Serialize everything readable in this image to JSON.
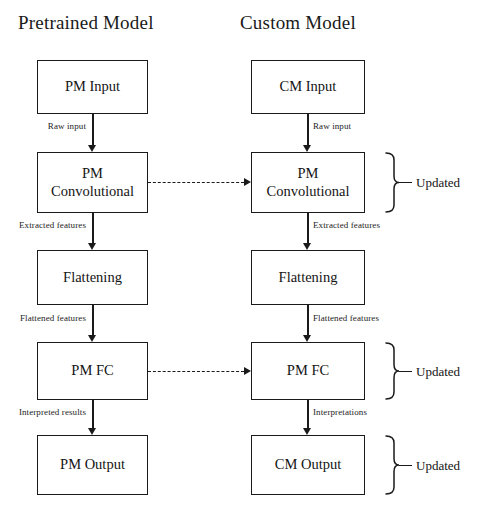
{
  "columns": {
    "left": {
      "title": "Pretrained Model"
    },
    "right": {
      "title": "Custom Model"
    }
  },
  "nodes": {
    "left": [
      {
        "id": "pm-input",
        "label": "PM Input"
      },
      {
        "id": "pm-convolutional",
        "label": "PM\nConvolutional"
      },
      {
        "id": "pm-flattening",
        "label": "Flattening"
      },
      {
        "id": "pm-fc",
        "label": "PM FC"
      },
      {
        "id": "pm-output",
        "label": "PM Output"
      }
    ],
    "right": [
      {
        "id": "cm-input",
        "label": "CM Input"
      },
      {
        "id": "cm-convolutional",
        "label": "PM\nConvolutional"
      },
      {
        "id": "cm-flattening",
        "label": "Flattening"
      },
      {
        "id": "cm-fc",
        "label": "PM FC"
      },
      {
        "id": "cm-output",
        "label": "CM Output"
      }
    ]
  },
  "edge_labels": {
    "left": [
      "Raw input",
      "Extracted features",
      "Flattened features",
      "Interpreted results"
    ],
    "right": [
      "Raw input",
      "Extracted features",
      "Flattened features",
      "Interpretations"
    ]
  },
  "annotations": [
    {
      "id": "updated-conv",
      "text": "Updated"
    },
    {
      "id": "updated-fc",
      "text": "Updated"
    },
    {
      "id": "updated-output",
      "text": "Updated"
    }
  ],
  "colors": {
    "stroke": "#1a1a1a",
    "background": "#ffffff",
    "text": "#141414"
  }
}
